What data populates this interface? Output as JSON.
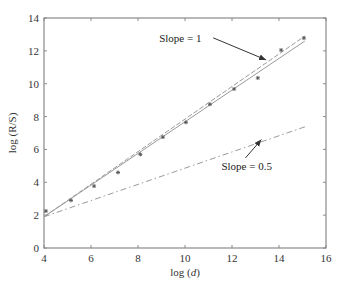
{
  "chart_data": {
    "type": "scatter",
    "title": "",
    "xlabel": "log (d)",
    "ylabel": "log (R/S)",
    "xlim": [
      4,
      16
    ],
    "ylim": [
      0,
      14
    ],
    "xticks": [
      4,
      6,
      8,
      10,
      12,
      14,
      16
    ],
    "yticks": [
      0,
      2,
      4,
      6,
      8,
      10,
      12,
      14
    ],
    "grid": false,
    "legend": null,
    "series": [
      {
        "name": "R/S data",
        "kind": "points",
        "marker": "*",
        "x": [
          4.08,
          5.15,
          6.13,
          7.15,
          8.1,
          9.06,
          10.04,
          11.06,
          12.09,
          13.1,
          14.09,
          15.06
        ],
        "y": [
          2.25,
          2.9,
          3.77,
          4.6,
          5.7,
          6.75,
          7.65,
          8.75,
          9.68,
          10.35,
          12.05,
          12.78
        ]
      },
      {
        "name": "Fitted line",
        "kind": "line",
        "style": "solid",
        "x": [
          4,
          15.1
        ],
        "y": [
          1.9,
          12.6
        ]
      },
      {
        "name": "Slope = 1 reference",
        "kind": "line",
        "style": "dashed",
        "x": [
          4,
          15.1
        ],
        "y": [
          1.9,
          12.9
        ]
      },
      {
        "name": "Slope = 0.5 reference",
        "kind": "line",
        "style": "dashdot",
        "x": [
          4,
          15.15
        ],
        "y": [
          1.9,
          7.4
        ]
      }
    ],
    "annotations": [
      {
        "text": "Slope = 1",
        "text_x": 8.9,
        "text_y": 12.55,
        "arrow_to_x": 13.45,
        "arrow_to_y": 11.45
      },
      {
        "text": "Slope = 0.5",
        "text_x": 11.55,
        "text_y": 4.75,
        "arrow_to_x": 13.25,
        "arrow_to_y": 6.6
      }
    ]
  },
  "colors": {
    "axis": "#8a8a8a",
    "points": "#555555",
    "lines": "#9a9a9a",
    "arrow": "#333333"
  }
}
